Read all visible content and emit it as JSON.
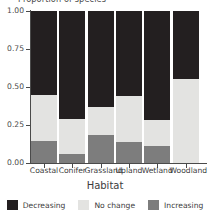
{
  "chart_data": {
    "type": "bar",
    "barmode": "stacked",
    "title": "",
    "ylabel": "Proportion of species",
    "xlabel": "Habitat",
    "ylim": [
      0,
      1
    ],
    "yticks": [
      "0.00",
      "0.25",
      "0.50",
      "0.75",
      "1.00"
    ],
    "ytick_values": [
      0,
      0.25,
      0.5,
      0.75,
      1
    ],
    "grid": false,
    "legend_position": "bottom",
    "categories": [
      "Coastal",
      "Conifer",
      "Grassland",
      "Upland",
      "Wetland",
      "Woodland"
    ],
    "series": [
      {
        "name": "Increasing",
        "color": "#7d7d7d",
        "values": [
          0.145,
          0.06,
          0.185,
          0.14,
          0.11,
          0.0
        ]
      },
      {
        "name": "No change",
        "color": "#e3e3e1",
        "values": [
          0.305,
          0.23,
          0.185,
          0.3,
          0.175,
          0.55
        ]
      },
      {
        "name": "Decreasing",
        "color": "#231f20",
        "values": [
          0.55,
          0.71,
          0.63,
          0.56,
          0.715,
          0.45
        ]
      }
    ],
    "stack_order_bottom_to_top": [
      "Increasing",
      "No change",
      "Decreasing"
    ],
    "legend": [
      {
        "label": "Decreasing",
        "color": "#231f20"
      },
      {
        "label": "No change",
        "color": "#e3e3e1"
      },
      {
        "label": "Increasing",
        "color": "#7d7d7d"
      }
    ]
  }
}
